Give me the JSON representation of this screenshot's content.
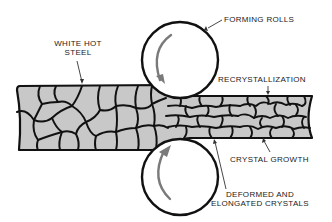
{
  "diagram": {
    "colors": {
      "background": "#ffffff",
      "steel_fill": "#c8c8c8",
      "grain_lines": "#111111",
      "roll_outline": "#111111",
      "roll_fill": "#ffffff",
      "rotation_arrow": "#7a7a7a",
      "leader_lines": "#333333",
      "text": "#222222"
    },
    "labels": {
      "white_hot_steel_line1": "WHITE HOT",
      "white_hot_steel_line2": "STEEL",
      "forming_rolls": "FORMING ROLLS",
      "recrystallization": "RECRYSTALLIZATION",
      "crystal_growth": "CRYSTAL GROWTH",
      "deformed_line1": "DEFORMED AND",
      "deformed_line2": "ELONGATED CRYSTALS"
    },
    "components": {
      "top_roll": {
        "cx": 180,
        "cy": 60,
        "r": 38,
        "rotation": "counterclockwise"
      },
      "bottom_roll": {
        "cx": 180,
        "cy": 177,
        "r": 38,
        "rotation": "clockwise"
      },
      "thick_slab": {
        "x1": 17,
        "x2": 165,
        "y1": 85,
        "y2": 150
      },
      "thin_strip": {
        "x1": 165,
        "x2": 315,
        "y1": 96,
        "y2": 138
      }
    }
  }
}
